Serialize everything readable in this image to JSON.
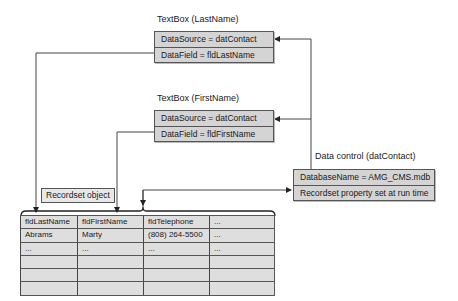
{
  "textbox_lastname": {
    "title": "TextBox (LastName)",
    "rows": [
      "DataSource = datContact",
      "DataField = fldLastName"
    ]
  },
  "textbox_firstname": {
    "title": "TextBox (FirstName)",
    "rows": [
      "DataSource = datContact",
      "DataField = fldFirstName"
    ]
  },
  "data_control": {
    "title": "Data control (datContact)",
    "rows": [
      "DatabaseName = AMG_CMS.mdb",
      "Recordset property set at run time"
    ]
  },
  "recordset_label": "Recordset object",
  "recordset_table": {
    "headers": [
      "fldLastName",
      "fldFirstName",
      "fldTelephone",
      "..."
    ],
    "rows": [
      [
        "Abrams",
        "Marty",
        "(808) 264-5500",
        "..."
      ],
      [
        "...",
        "...",
        "...",
        "..."
      ],
      [
        "",
        "",
        "",
        ""
      ],
      [
        "",
        "",
        "",
        ""
      ],
      [
        "",
        "",
        "",
        ""
      ]
    ]
  },
  "colors": {
    "box_fill": "#d4d4d4",
    "table_fill": "#dedede",
    "line": "#444444"
  }
}
